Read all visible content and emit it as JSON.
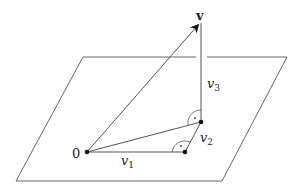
{
  "diagram": {
    "colors": {
      "stroke": "#555555",
      "points": "#111111",
      "text": "#222222",
      "background": "#ffffff"
    },
    "plane": {
      "corners": [
        [
          83,
          57
        ],
        [
          287,
          57
        ],
        [
          222,
          181
        ],
        [
          16,
          181
        ]
      ],
      "top_edge_gap": [
        196,
        207
      ]
    },
    "points": {
      "origin": {
        "x": 87,
        "y": 152,
        "label": "0"
      },
      "p1": {
        "x": 185,
        "y": 152
      },
      "p2": {
        "x": 201,
        "y": 122
      },
      "v_tip": {
        "x": 200,
        "y": 22
      }
    },
    "labels": {
      "v": "v",
      "origin": "0",
      "v1_main": "v",
      "v1_sub": "1",
      "v2_main": "v",
      "v2_sub": "2",
      "v3_main": "v",
      "v3_sub": "3"
    },
    "right_angle_markers": [
      {
        "at": "p1",
        "description": "between v1 and v2"
      },
      {
        "at": "p2",
        "description": "between v3 and segment 0-p2"
      }
    ]
  }
}
